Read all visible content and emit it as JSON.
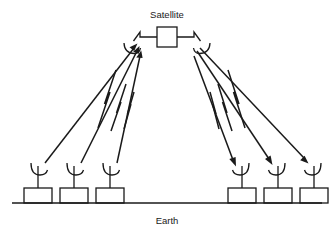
{
  "diagram": {
    "colors": {
      "background": "#ffffff",
      "stroke": "#1a1a1a",
      "text": "#1a1a1a"
    },
    "labels": {
      "satellite": "Satellite",
      "earth": "Earth"
    },
    "satellite": {
      "name": "satellite",
      "body": {
        "x": 157,
        "y": 27,
        "width": 20,
        "height": 20
      },
      "left_arm": {
        "elbow_x": 140,
        "elbow_y": 32,
        "dish_x": 131,
        "dish_y": 44
      },
      "right_arm": {
        "elbow_x": 194,
        "elbow_y": 32,
        "dish_x": 203,
        "dish_y": 44
      },
      "label_x": 167,
      "label_y": 17
    },
    "earth": {
      "ground_line": {
        "x1": 12,
        "y1": 203,
        "x2": 322,
        "y2": 203
      },
      "label_x": 167,
      "label_y": 221
    },
    "uplink_stations": [
      {
        "name": "uplink-station-1",
        "box_x": 24,
        "box_y": 188,
        "mast_x": 38,
        "dish_y": 168,
        "beam_start_x": 45,
        "beam_start_y": 163
      },
      {
        "name": "uplink-station-2",
        "box_x": 60,
        "box_y": 188,
        "mast_x": 74,
        "dish_y": 168,
        "beam_start_x": 81,
        "beam_start_y": 163
      },
      {
        "name": "uplink-station-3",
        "box_x": 96,
        "box_y": 188,
        "mast_x": 110,
        "dish_y": 168,
        "beam_start_x": 117,
        "beam_start_y": 163
      }
    ],
    "downlink_stations": [
      {
        "name": "downlink-station-1",
        "box_x": 228,
        "box_y": 188,
        "mast_x": 242,
        "dish_y": 168,
        "beam_end_x": 235,
        "beam_end_y": 163
      },
      {
        "name": "downlink-station-2",
        "box_x": 264,
        "box_y": 188,
        "mast_x": 278,
        "dish_y": 168,
        "beam_end_x": 271,
        "beam_end_y": 163
      },
      {
        "name": "downlink-station-3",
        "box_x": 300,
        "box_y": 188,
        "mast_x": 314,
        "dish_y": 168,
        "beam_end_x": 307,
        "beam_end_y": 163
      }
    ],
    "station_box": {
      "width": 28,
      "height": 15
    },
    "beams": {
      "uplink_count": 3,
      "downlink_count": 3,
      "uplink_direction": "ground-to-satellite",
      "downlink_direction": "satellite-to-ground",
      "marker": "lightning-bolt-zigzag"
    }
  }
}
